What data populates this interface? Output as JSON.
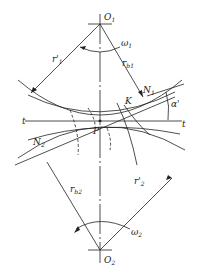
{
  "diagram": {
    "type": "gear-meshing-geometry",
    "labels": {
      "O1": "O",
      "O1_sub": "1",
      "O2": "O",
      "O2_sub": "2",
      "omega1": "ω",
      "omega1_sub": "1",
      "omega2": "ω",
      "omega2_sub": "2",
      "r1p": "r'",
      "r1p_sub": "1",
      "rb1": "r",
      "rb1_sub": "b1",
      "rb2": "r",
      "rb2_sub": "b2",
      "r2p": "r'",
      "r2p_sub": "2",
      "N1": "N",
      "N1_sub": "1",
      "N2": "N",
      "N2_sub": "2",
      "K": "K",
      "P": "P",
      "t_left": "t",
      "t_right": "t",
      "alpha": "α'"
    },
    "colors": {
      "line": "#222222",
      "background": "#ffffff"
    }
  }
}
